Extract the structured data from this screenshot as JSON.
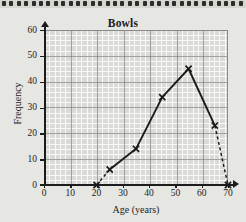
{
  "figure": {
    "title": "Bowls",
    "paper": "graph-grid",
    "colors": {
      "line": "#1a1a1a",
      "grid_major": "#5a5a5a",
      "grid_minor": "#ffffff",
      "plot_background": "#dadad6",
      "page_background": "#e6e6e2"
    }
  },
  "chart_data": {
    "type": "line",
    "title": "Bowls",
    "xlabel": "Age (years)",
    "ylabel": "Frequency",
    "xlim": [
      0,
      70
    ],
    "ylim": [
      0,
      60
    ],
    "xticks": [
      0,
      10,
      20,
      30,
      40,
      50,
      60,
      70
    ],
    "yticks": [
      0,
      10,
      20,
      30,
      40,
      50,
      60
    ],
    "grid": true,
    "legend": "none",
    "x": [
      20,
      25,
      35,
      45,
      55,
      65,
      70
    ],
    "values": [
      0,
      6,
      14,
      34,
      45,
      23,
      0
    ],
    "points": [
      {
        "x": 20,
        "y": 0,
        "marker": "cross",
        "segment_to_next": "dashed"
      },
      {
        "x": 25,
        "y": 6,
        "marker": "cross",
        "segment_to_next": "solid"
      },
      {
        "x": 35,
        "y": 14,
        "marker": "cross",
        "segment_to_next": "solid"
      },
      {
        "x": 45,
        "y": 34,
        "marker": "cross",
        "segment_to_next": "solid"
      },
      {
        "x": 55,
        "y": 45,
        "marker": "cross",
        "segment_to_next": "solid"
      },
      {
        "x": 65,
        "y": 23,
        "marker": "cross",
        "segment_to_next": "dashed"
      },
      {
        "x": 70,
        "y": 0,
        "marker": "cross",
        "segment_to_next": "none"
      }
    ]
  },
  "axes": {
    "x": {
      "title": "Age (years)",
      "ticks": [
        {
          "label": "0"
        },
        {
          "label": "10"
        },
        {
          "label": "20"
        },
        {
          "label": "30"
        },
        {
          "label": "40"
        },
        {
          "label": "50"
        },
        {
          "label": "60"
        },
        {
          "label": "70"
        }
      ]
    },
    "y": {
      "title": "Frequency",
      "ticks": [
        {
          "label": "60"
        },
        {
          "label": "50"
        },
        {
          "label": "40"
        },
        {
          "label": "30"
        },
        {
          "label": "20"
        },
        {
          "label": "10"
        },
        {
          "label": "0"
        }
      ]
    }
  }
}
